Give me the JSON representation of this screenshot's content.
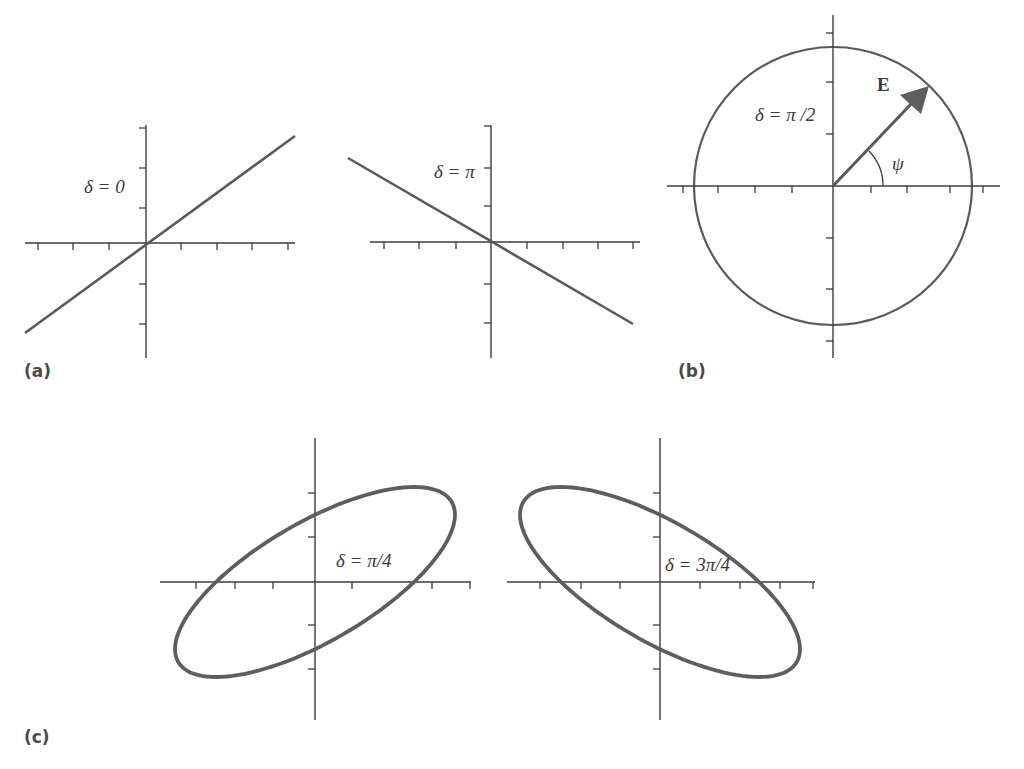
{
  "figure": {
    "colors": {
      "background": "#ffffff",
      "axis": "#3c3c3c",
      "curve": "#5a5a5a",
      "text": "#3a3a3a",
      "panel_label": "#4a4a4a"
    }
  },
  "panels": {
    "a": {
      "label": "(a)",
      "plots": [
        {
          "id": "delta-0",
          "annotation": "δ = 0",
          "shape": "line",
          "slope_sign": "positive",
          "origin": [
            146,
            243
          ],
          "x_axis": {
            "from": 25,
            "to": 295,
            "ticks": [
              38,
              73,
              109,
              181,
              217,
              252,
              288
            ]
          },
          "y_axis": {
            "from": 125,
            "to": 358,
            "ticks": [
              128,
              168,
              208,
              284,
              324
            ]
          },
          "line": {
            "x1": 25,
            "y1": 333,
            "x2": 295,
            "y2": 136
          }
        },
        {
          "id": "delta-pi",
          "annotation": "δ = π",
          "shape": "line",
          "slope_sign": "negative",
          "origin": [
            491,
            242
          ],
          "x_axis": {
            "from": 370,
            "to": 640,
            "ticks": [
              384,
              419,
              456,
              527,
              563,
              598,
              633
            ]
          },
          "y_axis": {
            "from": 125,
            "to": 358,
            "ticks": [
              126,
              168,
              206,
              284,
              323
            ]
          },
          "line": {
            "x1": 348,
            "y1": 158,
            "x2": 633,
            "y2": 324
          }
        }
      ]
    },
    "b": {
      "label": "(b)",
      "plots": [
        {
          "id": "delta-pi-over-2",
          "annotation": "δ = π /2",
          "shape": "circle",
          "origin": [
            833,
            186
          ],
          "radius": 139,
          "x_axis": {
            "from": 667,
            "to": 1000,
            "ticks": [
              683,
              718,
              755,
              792,
              871,
              907,
              950,
              983
            ]
          },
          "y_axis": {
            "from": 15,
            "to": 358,
            "ticks": [
              33,
              82,
              134,
              238,
              289,
              341
            ]
          },
          "vector": {
            "label": "E",
            "x2": 928,
            "y2": 88
          },
          "angle": {
            "label": "ψ",
            "radius": 50
          }
        }
      ]
    },
    "c": {
      "label": "(c)",
      "plots": [
        {
          "id": "delta-pi-over-4",
          "annotation": "δ = π/4",
          "shape": "ellipse",
          "tilt": "positive",
          "origin": [
            315,
            582
          ],
          "amplitude_x": 140,
          "amplitude_y": 95,
          "phase": 0.7854,
          "x_axis": {
            "from": 160,
            "to": 471,
            "ticks": [
              196,
              235,
              273,
              352,
              432,
              470
            ]
          },
          "y_axis": {
            "from": 438,
            "to": 720,
            "ticks": [
              493,
              537,
              625,
              669
            ]
          }
        },
        {
          "id": "delta-3pi-over-4",
          "annotation": "δ = 3π/4",
          "shape": "ellipse",
          "tilt": "negative",
          "origin": [
            660,
            582
          ],
          "amplitude_x": 140,
          "amplitude_y": 95,
          "phase": 2.3562,
          "x_axis": {
            "from": 507,
            "to": 815,
            "ticks": [
              540,
              581,
              620,
              700,
              740,
              780,
              813
            ]
          },
          "y_axis": {
            "from": 438,
            "to": 720,
            "ticks": [
              493,
              537,
              625,
              669
            ]
          }
        }
      ]
    }
  }
}
